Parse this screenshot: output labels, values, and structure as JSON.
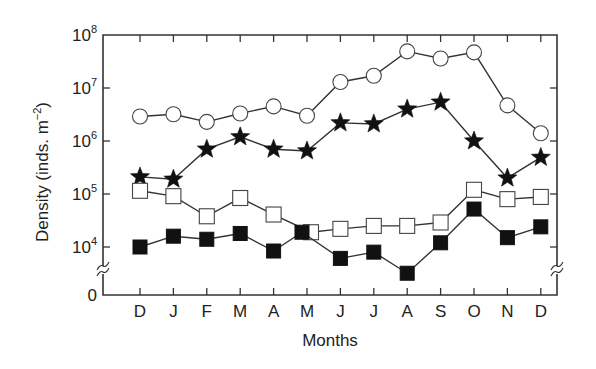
{
  "chart_data": {
    "type": "line",
    "title": "",
    "xlabel": "Months",
    "ylabel": "Density (inds. m⁻²)",
    "yscale": "log",
    "ylim": [
      1000,
      100000000
    ],
    "y_ticks": [
      {
        "label": "10",
        "exp": "8",
        "value": 100000000
      },
      {
        "label": "10",
        "exp": "7",
        "value": 10000000
      },
      {
        "label": "10",
        "exp": "6",
        "value": 1000000
      },
      {
        "label": "10",
        "exp": "5",
        "value": 100000
      },
      {
        "label": "10",
        "exp": "4",
        "value": 10000
      },
      {
        "label": "0",
        "exp": "",
        "value": 0
      }
    ],
    "axis_break": true,
    "grid": false,
    "legend": null,
    "categories": [
      "D",
      "J",
      "F",
      "M",
      "A",
      "M",
      "J",
      "J",
      "A",
      "S",
      "O",
      "N",
      "D"
    ],
    "series": [
      {
        "name": "open-circle",
        "marker": "circle-open",
        "values": [
          2900000,
          3200000,
          2300000,
          3300000,
          4500000,
          3000000,
          13000000,
          17000000,
          49000000,
          36000000,
          47000000,
          4700000,
          1400000
        ]
      },
      {
        "name": "filled-star",
        "marker": "star-filled",
        "values": [
          210000,
          190000,
          700000,
          1200000,
          700000,
          650000,
          2200000,
          2100000,
          4000000,
          5400000,
          1000000,
          200000,
          490000
        ]
      },
      {
        "name": "open-square",
        "marker": "square-open",
        "values": [
          115000,
          91000,
          38000,
          84000,
          41000,
          19000,
          22000,
          25000,
          25000,
          29000,
          120000,
          80000,
          88000
        ]
      },
      {
        "name": "filled-square",
        "marker": "square-filled",
        "values": [
          10000,
          16000,
          14000,
          18000,
          8400,
          19000,
          6100,
          8000,
          3200,
          12000,
          52000,
          15000,
          24000
        ]
      }
    ]
  }
}
